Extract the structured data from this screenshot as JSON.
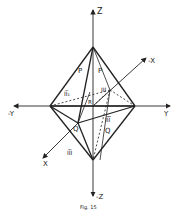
{
  "diagram": {
    "type": "octahedron-crystal-form",
    "axes": {
      "z_pos": "Z",
      "z_neg": "-Z",
      "y_pos": "Y",
      "y_neg": "-Y",
      "x_pos": "X",
      "x_neg": "-X"
    },
    "face_labels": {
      "p_left": "P",
      "p_right": "P",
      "q_front": "Q",
      "q_right": "Q",
      "r_center": "R"
    },
    "region_labels": {
      "upper_left": "II̅₁",
      "upper_right": "III",
      "lower_right": "II̅I̅",
      "lower_left": "II̅I"
    },
    "caption": "Fig. 15",
    "colors": {
      "line": "#222222",
      "background": "#ffffff"
    }
  }
}
